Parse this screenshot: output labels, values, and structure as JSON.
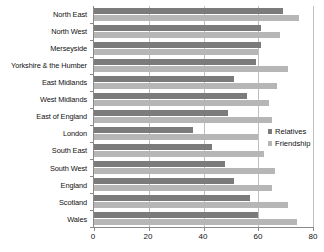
{
  "chart_data": {
    "type": "bar",
    "orientation": "horizontal",
    "title": "",
    "xlabel": "",
    "ylabel": "",
    "xlim": [
      0,
      80
    ],
    "ylim": null,
    "grid": true,
    "xticks": [
      0,
      20,
      40,
      60,
      80
    ],
    "xtick_labels": [
      "0",
      "20",
      "40",
      "60",
      "80"
    ],
    "legend_position": "center-right",
    "categories": [
      "North East",
      "North West",
      "Merseyside",
      "Yorkshire & the Humber",
      "East Midlands",
      "West Midlands",
      "East of England",
      "London",
      "South East",
      "South West",
      "England",
      "Scotland",
      "Wales"
    ],
    "series": [
      {
        "name": "Relatives",
        "color": "#7b7b7b",
        "values": [
          69,
          61,
          61,
          59,
          51,
          56,
          49,
          36,
          43,
          48,
          51,
          57,
          60
        ]
      },
      {
        "name": "Friendship",
        "color": "#b6b6b6",
        "values": [
          75,
          68,
          60,
          71,
          67,
          64,
          65,
          60,
          62,
          66,
          65,
          71,
          74
        ]
      }
    ]
  },
  "legend": {
    "items": [
      {
        "label": "Relatives",
        "color": "#7b7b7b"
      },
      {
        "label": "Friendship",
        "color": "#b6b6b6"
      }
    ]
  },
  "colors": {
    "relatives": "#7b7b7b",
    "friendship": "#b6b6b6",
    "axis": "#8a8a8a",
    "grid": "#bfbfbf",
    "background": "#ffffff",
    "text": "#111111"
  }
}
